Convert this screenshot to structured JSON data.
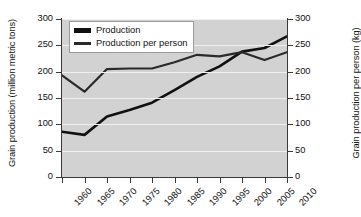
{
  "chart_data": {
    "type": "line",
    "title": "",
    "xlabel": "",
    "ylabel": "Grain production (million metric tons)",
    "ylabel_right": "Grain production per person (kg)",
    "x": [
      1960,
      1965,
      1970,
      1975,
      1980,
      1985,
      1990,
      1995,
      2000,
      2005,
      2010
    ],
    "categories": [
      "1960",
      "1965",
      "1970",
      "1975",
      "1980",
      "1985",
      "1990",
      "1995",
      "2000",
      "2005",
      "2010"
    ],
    "xlim": [
      1960,
      2010
    ],
    "ylim": [
      0,
      300
    ],
    "ylim_right": [
      0,
      300
    ],
    "yticks": [
      0,
      50,
      100,
      150,
      200,
      250,
      300
    ],
    "ytick_labels": [
      "0",
      "50",
      "100",
      "150",
      "200",
      "250",
      "300"
    ],
    "yticks_right": [
      0,
      50,
      100,
      150,
      200,
      250,
      300
    ],
    "ytick_labels_right": [
      "0",
      "50",
      "100",
      "150",
      "200",
      "250",
      "300"
    ],
    "xtick_labels": [
      "1960",
      "1965",
      "1970",
      "1975",
      "1980",
      "1985",
      "1990",
      "1995",
      "2000",
      "2005",
      "2010"
    ],
    "grid": true,
    "grid_color": "#f0f0f0",
    "plot_background": "#d2d2d2",
    "legend_position": "upper left",
    "series": [
      {
        "name": "Production",
        "axis": "left",
        "color": "#111111",
        "linewidth": 2.6,
        "values": [
          86,
          80,
          115,
          127,
          141,
          165,
          190,
          210,
          238,
          245,
          267
        ]
      },
      {
        "name": "Production per person",
        "axis": "right",
        "color": "#2a2a2a",
        "linewidth": 2.2,
        "values": [
          193,
          162,
          205,
          206,
          206,
          218,
          232,
          229,
          237,
          222,
          237
        ]
      }
    ]
  },
  "legend": {
    "items": [
      {
        "label": "Production"
      },
      {
        "label": "Production per person"
      }
    ]
  },
  "axes": {
    "left_title": "Grain production (million metric tons)",
    "right_title": "Grain production per person (kg)"
  }
}
